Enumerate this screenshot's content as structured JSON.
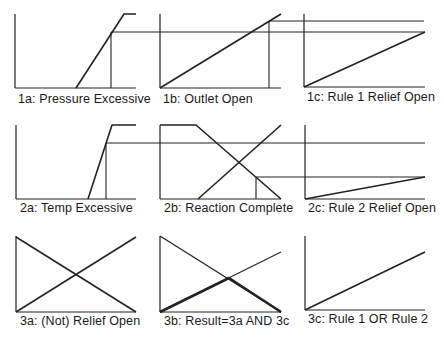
{
  "figure": {
    "ink_color": "#222222",
    "background": "#ffffff"
  },
  "panels": [
    {
      "id": "1a",
      "label": "1a: Pressure Excessive",
      "label_x": 18,
      "label_y": 92
    },
    {
      "id": "1b",
      "label": "1b: Outlet Open",
      "label_x": 163,
      "label_y": 92
    },
    {
      "id": "1c",
      "label": "1c: Rule 1 Relief Open",
      "label_x": 307,
      "label_y": 90
    },
    {
      "id": "2a",
      "label": "2a: Temp Excessive",
      "label_x": 20,
      "label_y": 201
    },
    {
      "id": "2b",
      "label": "2b: Reaction Complete",
      "label_x": 164,
      "label_y": 201
    },
    {
      "id": "2c",
      "label": "2c: Rule 2 Relief Open",
      "label_x": 308,
      "label_y": 201
    },
    {
      "id": "3a",
      "label": "3a: (Not) Relief Open",
      "label_x": 20,
      "label_y": 314
    },
    {
      "id": "3b",
      "label": "3b: Result=3a AND 3c",
      "label_x": 164,
      "label_y": 314
    },
    {
      "id": "3c",
      "label": "3c: Rule 1  OR  Rule 2",
      "label_x": 308,
      "label_y": 312
    }
  ],
  "lines": [
    {
      "panel": "1a",
      "name": "axis-y",
      "points": [
        [
          15,
          14
        ],
        [
          15,
          88
        ]
      ],
      "w": 1.2
    },
    {
      "panel": "1a",
      "name": "axis-x",
      "points": [
        [
          15,
          88
        ],
        [
          136,
          88
        ]
      ],
      "w": 1.2
    },
    {
      "panel": "1a",
      "name": "membership-ramp",
      "points": [
        [
          76,
          88
        ],
        [
          124,
          14
        ],
        [
          136,
          14
        ]
      ],
      "w": 1.6
    },
    {
      "panel": "1a",
      "name": "input-marker",
      "points": [
        [
          111,
          88
        ],
        [
          111,
          32
        ]
      ],
      "w": 1.1
    },
    {
      "panel": "1a",
      "name": "degree-projection",
      "points": [
        [
          111,
          32
        ],
        [
          425,
          32
        ]
      ],
      "w": 1.0
    },
    {
      "panel": "1b",
      "name": "axis-y",
      "points": [
        [
          160,
          14
        ],
        [
          160,
          88
        ]
      ],
      "w": 1.2
    },
    {
      "panel": "1b",
      "name": "axis-x",
      "points": [
        [
          160,
          88
        ],
        [
          281,
          88
        ]
      ],
      "w": 1.2
    },
    {
      "panel": "1b",
      "name": "membership-ramp",
      "points": [
        [
          160,
          88
        ],
        [
          281,
          14
        ]
      ],
      "w": 1.6
    },
    {
      "panel": "1b",
      "name": "input-marker",
      "points": [
        [
          269,
          88
        ],
        [
          269,
          21
        ]
      ],
      "w": 1.1
    },
    {
      "panel": "1b",
      "name": "degree-projection",
      "points": [
        [
          269,
          21
        ],
        [
          424,
          21
        ]
      ],
      "w": 1.0
    },
    {
      "panel": "1c",
      "name": "axis-y",
      "points": [
        [
          304,
          14
        ],
        [
          304,
          87
        ]
      ],
      "w": 1.2
    },
    {
      "panel": "1c",
      "name": "axis-x",
      "points": [
        [
          304,
          87
        ],
        [
          425,
          87
        ]
      ],
      "w": 1.2
    },
    {
      "panel": "1c",
      "name": "output-ramp",
      "points": [
        [
          304,
          87
        ],
        [
          425,
          32
        ]
      ],
      "w": 1.6
    },
    {
      "panel": "2a",
      "name": "axis-y",
      "points": [
        [
          16,
          125
        ],
        [
          16,
          199
        ]
      ],
      "w": 1.2
    },
    {
      "panel": "2a",
      "name": "axis-x",
      "points": [
        [
          16,
          199
        ],
        [
          136,
          199
        ]
      ],
      "w": 1.2
    },
    {
      "panel": "2a",
      "name": "membership-ramp",
      "points": [
        [
          88,
          199
        ],
        [
          112,
          125
        ],
        [
          136,
          125
        ]
      ],
      "w": 1.6
    },
    {
      "panel": "2a",
      "name": "input-marker",
      "points": [
        [
          106,
          199
        ],
        [
          106,
          143
        ]
      ],
      "w": 1.1
    },
    {
      "panel": "2a",
      "name": "degree-projection",
      "points": [
        [
          106,
          143
        ],
        [
          425,
          143
        ]
      ],
      "w": 1.0
    },
    {
      "panel": "2b",
      "name": "axis-y",
      "points": [
        [
          160,
          125
        ],
        [
          160,
          199
        ]
      ],
      "w": 1.2
    },
    {
      "panel": "2b",
      "name": "axis-x",
      "points": [
        [
          160,
          199
        ],
        [
          281,
          199
        ]
      ],
      "w": 1.2
    },
    {
      "panel": "2b",
      "name": "membership-falling",
      "points": [
        [
          160,
          125
        ],
        [
          196,
          125
        ],
        [
          281,
          199
        ]
      ],
      "w": 1.6
    },
    {
      "panel": "2b",
      "name": "membership-rising",
      "points": [
        [
          198,
          199
        ],
        [
          281,
          125
        ]
      ],
      "w": 1.6
    },
    {
      "panel": "2b",
      "name": "input-marker",
      "points": [
        [
          256,
          199
        ],
        [
          256,
          177
        ]
      ],
      "w": 1.1
    },
    {
      "panel": "2b",
      "name": "degree-projection",
      "points": [
        [
          256,
          177
        ],
        [
          425,
          177
        ]
      ],
      "w": 1.0
    },
    {
      "panel": "2c",
      "name": "axis-y",
      "points": [
        [
          305,
          125
        ],
        [
          305,
          199
        ]
      ],
      "w": 1.2
    },
    {
      "panel": "2c",
      "name": "axis-x",
      "points": [
        [
          305,
          199
        ],
        [
          425,
          199
        ]
      ],
      "w": 1.2
    },
    {
      "panel": "2c",
      "name": "output-ramp",
      "points": [
        [
          305,
          199
        ],
        [
          425,
          177
        ]
      ],
      "w": 1.6
    },
    {
      "panel": "3a",
      "name": "axis-y",
      "points": [
        [
          16,
          236
        ],
        [
          16,
          312
        ]
      ],
      "w": 1.2
    },
    {
      "panel": "3a",
      "name": "axis-x",
      "points": [
        [
          16,
          312
        ],
        [
          136,
          312
        ]
      ],
      "w": 1.2
    },
    {
      "panel": "3a",
      "name": "not-relief-falling",
      "points": [
        [
          16,
          237
        ],
        [
          136,
          312
        ]
      ],
      "w": 1.5
    },
    {
      "panel": "3a",
      "name": "relief-rising",
      "points": [
        [
          16,
          312
        ],
        [
          136,
          237
        ]
      ],
      "w": 1.5
    },
    {
      "panel": "3b",
      "name": "axis-y",
      "points": [
        [
          160,
          236
        ],
        [
          160,
          312
        ]
      ],
      "w": 1.2
    },
    {
      "panel": "3b",
      "name": "axis-x",
      "points": [
        [
          160,
          312
        ],
        [
          281,
          312
        ]
      ],
      "w": 1.2
    },
    {
      "panel": "3b",
      "name": "falling-line",
      "points": [
        [
          160,
          236
        ],
        [
          281,
          312
        ]
      ],
      "w": 1.3
    },
    {
      "panel": "3b",
      "name": "rising-line",
      "points": [
        [
          160,
          312
        ],
        [
          281,
          252
        ]
      ],
      "w": 1.1
    },
    {
      "panel": "3b",
      "name": "and-result",
      "points": [
        [
          160,
          312
        ],
        [
          229,
          278
        ],
        [
          281,
          312
        ]
      ],
      "w": 2.6
    },
    {
      "panel": "3c",
      "name": "axis-y",
      "points": [
        [
          305,
          236
        ],
        [
          305,
          310
        ]
      ],
      "w": 1.2
    },
    {
      "panel": "3c",
      "name": "axis-x",
      "points": [
        [
          305,
          310
        ],
        [
          425,
          310
        ]
      ],
      "w": 1.2
    },
    {
      "panel": "3c",
      "name": "or-result",
      "points": [
        [
          305,
          310
        ],
        [
          425,
          252
        ]
      ],
      "w": 1.6
    }
  ]
}
